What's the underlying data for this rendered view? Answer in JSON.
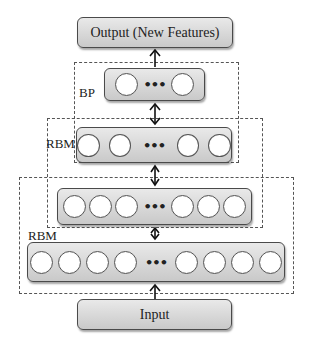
{
  "diagram": {
    "output_box": {
      "label": "Output (New Features)"
    },
    "input_box": {
      "label": "Input"
    },
    "groups": [
      {
        "id": "bp",
        "label": "BP"
      },
      {
        "id": "rbm-upper",
        "label": "RBM"
      },
      {
        "id": "rbm-lower",
        "label": "RBM"
      }
    ],
    "layers": [
      {
        "id": "layer-1-top",
        "visible_nodes_left": 1,
        "visible_nodes_right": 1,
        "ellipsis": "•••"
      },
      {
        "id": "layer-2",
        "visible_nodes_left": 2,
        "visible_nodes_right": 2,
        "ellipsis": "•••"
      },
      {
        "id": "layer-3",
        "visible_nodes_left": 3,
        "visible_nodes_right": 3,
        "ellipsis": "•••"
      },
      {
        "id": "layer-4-bottom",
        "visible_nodes_left": 4,
        "visible_nodes_right": 4,
        "ellipsis": "•••"
      }
    ],
    "connections": [
      {
        "from": "input",
        "to": "layer-4-bottom",
        "type": "single-arrow-up"
      },
      {
        "from": "layer-4-bottom",
        "to": "layer-3",
        "type": "bidirectional"
      },
      {
        "from": "layer-3",
        "to": "layer-2",
        "type": "bidirectional"
      },
      {
        "from": "layer-2",
        "to": "layer-1-top",
        "type": "bidirectional"
      },
      {
        "from": "layer-1-top",
        "to": "output",
        "type": "single-arrow-up"
      }
    ],
    "colors": {
      "box_fill_top": "#e9e9e9",
      "box_fill_bottom": "#c9c9c9",
      "stroke": "#4a4a4a",
      "node_fill": "#ffffff"
    }
  }
}
